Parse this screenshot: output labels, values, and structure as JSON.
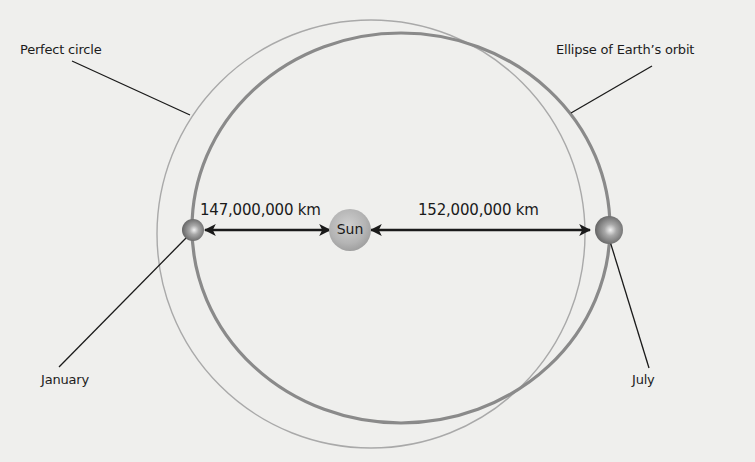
{
  "diagram": {
    "type": "orbit-diagram",
    "labels": {
      "perfect_circle": "Perfect circle",
      "ellipse": "Ellipse of Earth’s orbit",
      "january": "January",
      "july": "July",
      "sun": "Sun"
    },
    "distances": {
      "perihelion": "147,000,000 km",
      "aphelion": "152,000,000 km"
    },
    "colors": {
      "background": "#efefed",
      "circle_stroke": "#a9a9a9",
      "ellipse_stroke": "#8a8a8a",
      "sun_fill": "#b8b8b8",
      "earth_fill": "#6e6e6e",
      "arrow": "#1a1a1a",
      "text": "#1c1c1c"
    }
  }
}
